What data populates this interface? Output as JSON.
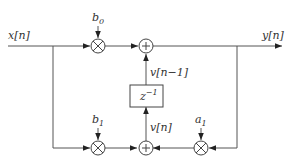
{
  "diagram": {
    "type": "signal-flow block diagram",
    "title": "",
    "signals": {
      "input": "x[n]",
      "output": "y[n]",
      "state": "v[n]",
      "delayed_state": "v[n−1]"
    },
    "delay_block": {
      "label_base": "z",
      "label_exp": "−1"
    },
    "coefficients": {
      "b0": {
        "base": "b",
        "sub": "0"
      },
      "b1": {
        "base": "b",
        "sub": "1"
      },
      "a1": {
        "base": "a",
        "sub": "1"
      }
    },
    "nodes": [
      {
        "id": "mult-b0",
        "kind": "multiplier"
      },
      {
        "id": "add-top",
        "kind": "adder"
      },
      {
        "id": "delay",
        "kind": "delay"
      },
      {
        "id": "add-bottom",
        "kind": "adder"
      },
      {
        "id": "mult-b1",
        "kind": "multiplier"
      },
      {
        "id": "mult-a1",
        "kind": "multiplier"
      }
    ],
    "edges": [
      {
        "from": "x[n]",
        "to": "mult-b0"
      },
      {
        "from": "x[n]",
        "to": "mult-b1"
      },
      {
        "from": "mult-b0",
        "to": "add-top"
      },
      {
        "from": "add-top",
        "to": "y[n]"
      },
      {
        "from": "y[n]",
        "to": "mult-a1"
      },
      {
        "from": "mult-a1",
        "to": "add-bottom"
      },
      {
        "from": "mult-b1",
        "to": "add-bottom"
      },
      {
        "from": "add-bottom",
        "to": "delay",
        "label": "v[n]"
      },
      {
        "from": "delay",
        "to": "add-top",
        "label": "v[n−1]"
      }
    ]
  }
}
